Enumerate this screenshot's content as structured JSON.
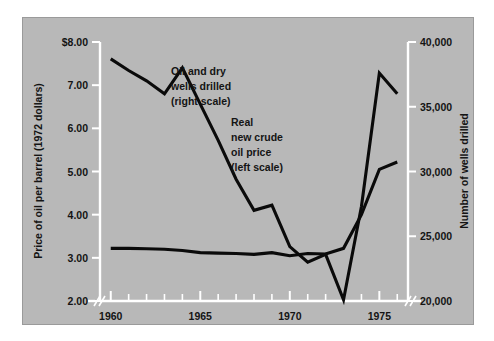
{
  "figure": {
    "background_color": "#ffffff",
    "plate_color": "#b8b8b8",
    "series_color": "#0a0a0a",
    "axis_color": "#ffffff"
  },
  "left_axis": {
    "title": "Price of oil per barrel (1972 dollars)",
    "ticks": [
      "$8.00",
      "7.00",
      "6.00",
      "5.00",
      "4.00",
      "3.00",
      "2.00"
    ],
    "values": [
      8,
      7,
      6,
      5,
      4,
      3,
      2
    ],
    "min": 2,
    "max": 8
  },
  "right_axis": {
    "title": "Number of wells drilled",
    "ticks": [
      "40,000",
      "35,000",
      "30,000",
      "25,000",
      "20,000"
    ],
    "values": [
      40000,
      35000,
      30000,
      25000,
      20000
    ],
    "min": 20000,
    "max": 40000
  },
  "x_axis": {
    "ticks": [
      "1960",
      "1965",
      "1970",
      "1975"
    ],
    "values": [
      1960,
      1965,
      1970,
      1975
    ],
    "min": 1959.4,
    "max": 1976.6,
    "break_marks": [
      "left",
      "right"
    ]
  },
  "annotations": [
    {
      "id": "wells-label",
      "lines": [
        "Oil and dry",
        "wells drilled",
        "(right scale)"
      ]
    },
    {
      "id": "price-label",
      "lines": [
        "Real",
        "new crude",
        "oil price",
        "(left scale)"
      ]
    }
  ],
  "chart_data": {
    "type": "line",
    "title": "",
    "subtitle": "",
    "xlabel": "",
    "ylabel": "Price of oil per barrel (1972 dollars)",
    "y2label": "Number of wells drilled",
    "ylim": [
      2,
      8
    ],
    "y2lim": [
      20000,
      40000
    ],
    "xlim": [
      1959.4,
      1976.6
    ],
    "grid": false,
    "legend": "annotations-on-plot",
    "x": [
      1960,
      1961,
      1962,
      1963,
      1964,
      1965,
      1966,
      1967,
      1968,
      1969,
      1970,
      1971,
      1972,
      1973,
      1974,
      1975,
      1976
    ],
    "series": [
      {
        "name": "Oil and dry wells drilled (right scale)",
        "axis": "right",
        "units": "wells",
        "values": [
          38700,
          37800,
          37000,
          36000,
          38000,
          35200,
          32400,
          29400,
          27000,
          27400,
          24200,
          23000,
          23600,
          20100,
          27300,
          37600,
          36000
        ]
      },
      {
        "name": "Real new crude oil price (left scale)",
        "axis": "left",
        "units": "1972 dollars per barrel",
        "values": [
          3.22,
          3.22,
          3.21,
          3.2,
          3.17,
          3.12,
          3.11,
          3.1,
          3.08,
          3.12,
          3.05,
          3.1,
          3.09,
          3.22,
          4.0,
          5.05,
          5.22
        ]
      }
    ],
    "annotations": [
      {
        "text": "Oil and dry wells drilled (right scale)",
        "x": 1965.2,
        "y": 6.6
      },
      {
        "text": "Real new crude oil price (left scale)",
        "x": 1968.6,
        "y": 5.4
      }
    ]
  }
}
